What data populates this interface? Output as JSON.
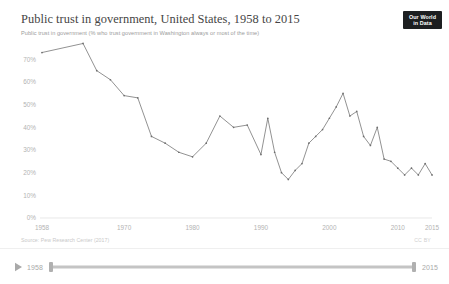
{
  "header": {
    "title": "Public trust in government, United States, 1958 to 2015",
    "subtitle": "Public trust in government (% who trust government in Washington always or most of the time)"
  },
  "logo": {
    "line1": "Our World",
    "line2": "in Data",
    "background": "#1d1f21",
    "text_color": "#ffffff"
  },
  "footer": {
    "source": "Source: Pew Research Center (2017)",
    "license": "CC BY"
  },
  "timeline": {
    "play_icon": "play-icon",
    "start_label": "1958",
    "end_label": "2015"
  },
  "chart_data": {
    "type": "line",
    "title": "Public trust in government, United States, 1958 to 2015",
    "subtitle": "Public trust in government (% who trust government in Washington always or most of the time)",
    "xlabel": "",
    "ylabel": "",
    "xlim": [
      1958,
      2015
    ],
    "ylim": [
      0,
      75
    ],
    "grid": false,
    "legend": "none",
    "line_color": "#6e6e6e",
    "y_ticks": [
      0,
      10,
      20,
      30,
      40,
      50,
      60,
      70
    ],
    "y_tick_labels": [
      "0%",
      "10%",
      "20%",
      "30%",
      "40%",
      "50%",
      "60%",
      "70%"
    ],
    "x_ticks": [
      1958,
      1970,
      1980,
      1990,
      2000,
      2010,
      2015
    ],
    "x_tick_labels": [
      "1958",
      "1970",
      "1980",
      "1990",
      "2000",
      "2010",
      "2015"
    ],
    "x": [
      1958,
      1964,
      1966,
      1968,
      1970,
      1972,
      1974,
      1976,
      1978,
      1980,
      1982,
      1984,
      1986,
      1988,
      1990,
      1991,
      1992,
      1993,
      1994,
      1995,
      1996,
      1997,
      1998,
      1999,
      2000,
      2001,
      2002,
      2003,
      2004,
      2005,
      2006,
      2007,
      2008,
      2009,
      2010,
      2011,
      2012,
      2013,
      2014,
      2015
    ],
    "values": [
      73,
      77,
      65,
      61,
      54,
      53,
      36,
      33,
      29,
      27,
      33,
      45,
      40,
      41,
      28,
      44,
      29,
      20,
      17,
      21,
      24,
      33,
      36,
      39,
      44,
      49,
      55,
      45,
      47,
      36,
      32,
      40,
      26,
      25,
      22,
      19,
      22,
      19,
      24,
      19
    ]
  }
}
